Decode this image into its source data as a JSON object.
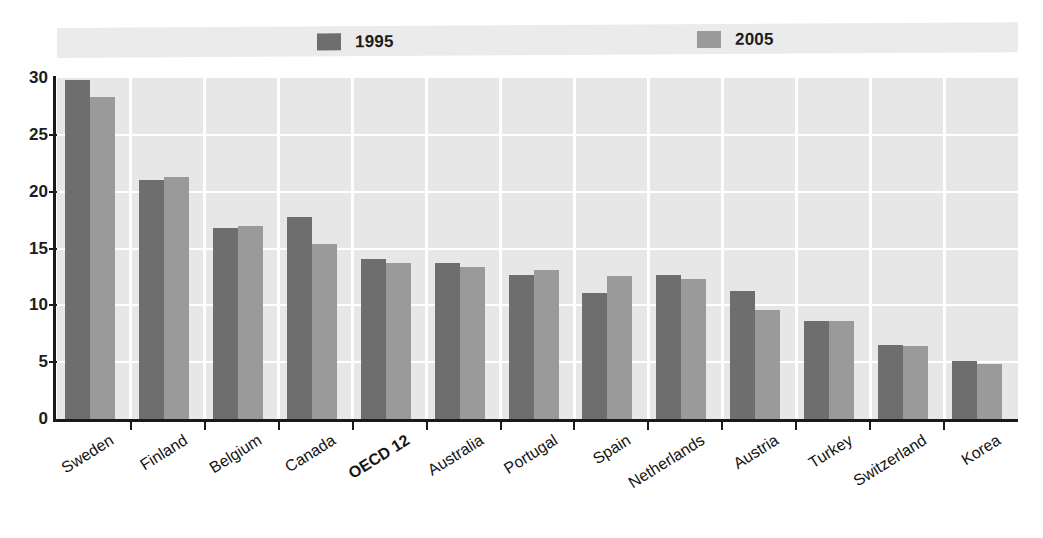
{
  "chart_data": {
    "type": "bar",
    "title": "",
    "subtitle": "",
    "xlabel": "",
    "ylabel": "",
    "ylim": [
      0,
      30
    ],
    "yticks": [
      0,
      5,
      10,
      15,
      20,
      25,
      30
    ],
    "ytick_labels": [
      "0",
      "5",
      "10",
      "15",
      "20",
      "25",
      "30"
    ],
    "grid": true,
    "legend_position": "top",
    "categories": [
      "Sweden",
      "Finland",
      "Belgium",
      "Canada",
      "OECD 12",
      "Australia",
      "Portugal",
      "Spain",
      "Netherlands",
      "Austria",
      "Turkey",
      "Switzerland",
      "Korea"
    ],
    "highlight_categories": [
      "OECD 12"
    ],
    "series": [
      {
        "name": "1995",
        "color": "#6e6e6e",
        "values": [
          29.8,
          21.0,
          16.8,
          17.8,
          14.1,
          13.7,
          12.7,
          11.1,
          12.7,
          11.3,
          8.6,
          6.5,
          5.1
        ]
      },
      {
        "name": "2005",
        "color": "#9a9a9a",
        "values": [
          28.3,
          21.3,
          17.0,
          15.4,
          13.7,
          13.4,
          13.1,
          12.6,
          12.3,
          9.6,
          8.6,
          6.4,
          4.8
        ]
      }
    ]
  },
  "legend": {
    "entries": [
      {
        "label": "1995",
        "color": "#6e6e6e"
      },
      {
        "label": "2005",
        "color": "#9a9a9a"
      }
    ]
  },
  "colors": {
    "plot_background": "#e7e7e7",
    "legend_background": "#ebebeb",
    "gridline": "#ffffff",
    "axis": "#1a1a1a",
    "series_1995": "#6e6e6e",
    "series_2005": "#9a9a9a"
  }
}
